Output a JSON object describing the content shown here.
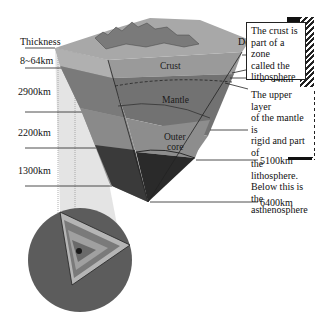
{
  "diagram": {
    "thickness": {
      "header": "Thickness",
      "values": [
        "8~64km",
        "2900km",
        "2200km",
        "1300km"
      ]
    },
    "depth": {
      "header": "Depth",
      "values": [
        "0",
        "8~64km",
        "2900km",
        "5100km",
        "6400km"
      ]
    },
    "layers": {
      "crust": "Crust",
      "mantle": "Mantle",
      "outer_core_line1": "Outer",
      "outer_core_line2": "core",
      "inner_core": "Inner core"
    },
    "callouts": [
      {
        "lines": [
          "The crust is",
          "part of a zone",
          "called the",
          "lithosphere"
        ]
      },
      {
        "lines": [
          "The upper layer",
          "of the mantle is",
          "rigid and part of",
          "the lithosphere.",
          "Below this is the",
          "asthenosphere"
        ]
      }
    ],
    "colors": {
      "crust": "#8a8a8a",
      "mantle": "#6e6e6e",
      "outer_core": "#8c8c8c",
      "inner_core": "#2a2a2a",
      "globe": "#5a5a5a"
    }
  }
}
